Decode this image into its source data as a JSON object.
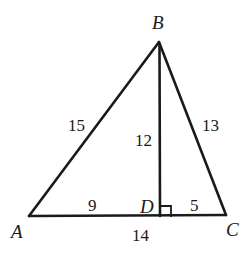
{
  "figure": {
    "type": "geometry-diagram",
    "shape": "triangle-with-altitude",
    "background_color": "#ffffff",
    "stroke_color": "#1a1a1a"
  },
  "vertices": [
    {
      "id": "A",
      "label": "A",
      "x": 29,
      "y": 216,
      "label_x": 11,
      "label_y": 222
    },
    {
      "id": "B",
      "label": "B",
      "x": 159,
      "y": 42,
      "label_x": 152,
      "label_y": 13
    },
    {
      "id": "C",
      "label": "C",
      "x": 226,
      "y": 215,
      "label_x": 226,
      "label_y": 220
    },
    {
      "id": "D",
      "label": "D",
      "x": 160,
      "y": 216,
      "label_x": 140,
      "label_y": 197
    }
  ],
  "segments": [
    {
      "id": "AB",
      "from": "A",
      "to": "B"
    },
    {
      "id": "BC",
      "from": "B",
      "to": "C"
    },
    {
      "id": "AC",
      "from": "A",
      "to": "C"
    },
    {
      "id": "BD",
      "from": "B",
      "to": "D"
    }
  ],
  "measures": [
    {
      "id": "AB",
      "text": "15",
      "x": 68,
      "y": 117
    },
    {
      "id": "BC",
      "text": "13",
      "x": 202,
      "y": 117
    },
    {
      "id": "BD",
      "text": "12",
      "x": 135,
      "y": 132
    },
    {
      "id": "AD",
      "text": "9",
      "x": 88,
      "y": 197
    },
    {
      "id": "DC",
      "text": "5",
      "x": 190,
      "y": 197
    },
    {
      "id": "AC",
      "text": "14",
      "x": 132,
      "y": 227
    }
  ],
  "right_angle": {
    "id": "angle-BDC",
    "at": "D",
    "marker": "right-angle-square",
    "x": 161,
    "y": 206,
    "size": 10
  }
}
